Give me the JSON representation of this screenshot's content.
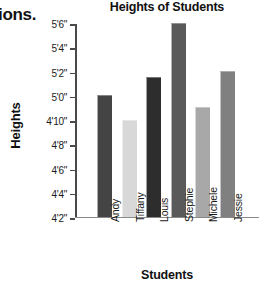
{
  "page": {
    "edge_text_fragment": "ions."
  },
  "chart_data": {
    "type": "bar",
    "title": "Heights of Students",
    "xlabel": "Students",
    "ylabel": "Heights",
    "categories": [
      "Andy",
      "Tiffany",
      "Louis",
      "Stephie",
      "Michele",
      "Jessie"
    ],
    "values": [
      60,
      58,
      61.5,
      66,
      59,
      62
    ],
    "value_labels": [
      "5'0\"",
      "4'10\"",
      "5'1\"",
      "5'6\"",
      "4'11\"",
      "5'2\""
    ],
    "value_units": "inches",
    "ylim": [
      50,
      66
    ],
    "ytick_values": [
      50,
      52,
      54,
      56,
      58,
      60,
      62,
      64,
      66
    ],
    "ytick_labels": [
      "4'2\"",
      "4'4\"",
      "4'6\"",
      "4'8\"",
      "4'10\"",
      "5'0\"",
      "5'2\"",
      "5'4\"",
      "5'6\""
    ],
    "grid": false,
    "legend": false,
    "bar_colors": [
      "#444444",
      "#d8d8d8",
      "#2d2d2d",
      "#5a5a5a",
      "#a8a8a8",
      "#808080"
    ],
    "axis_color": "#4a4a4a"
  }
}
